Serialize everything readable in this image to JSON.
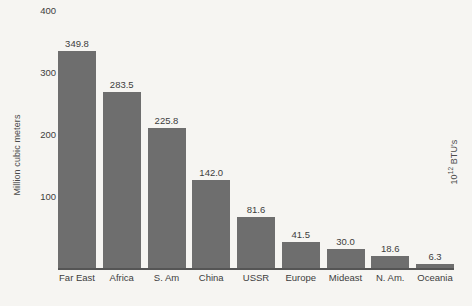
{
  "chart_data": {
    "type": "bar",
    "title": "",
    "subtitle": "",
    "xlabel": "",
    "ylabel": "Million cubic meters",
    "ylabel_right": "10¹² BTU's",
    "ylabel_right_base": "10",
    "ylabel_right_exponent": "12",
    "ylabel_right_suffix": " BTU's",
    "categories": [
      "Far East",
      "Africa",
      "S. Am",
      "China",
      "USSR",
      "Europe",
      "Mideast",
      "N. Am.",
      "Oceania"
    ],
    "values": [
      349.8,
      283.5,
      225.8,
      142.0,
      81.6,
      41.5,
      30.0,
      18.6,
      6.3
    ],
    "value_labels": [
      "349.8",
      "283.5",
      "225.8",
      "142.0",
      "81.6",
      "41.5",
      "30.0",
      "18.6",
      "6.3"
    ],
    "ylim": [
      0,
      400
    ],
    "yticks": [
      100,
      200,
      300,
      400
    ],
    "ytick_labels": [
      "100",
      "200",
      "300",
      "400"
    ],
    "grid": false,
    "legend": false,
    "legend_position": "none",
    "bar_color": "#6e6e6e",
    "background_color": "#f6f5f2",
    "text_color": "#3d3d3d",
    "axis_color": "#555555"
  }
}
